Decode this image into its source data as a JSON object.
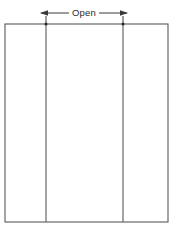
{
  "diagram": {
    "title": "Open",
    "background_color": "#ffffff",
    "line_color": "#5a5a5a",
    "dimension_color": "#3a3a3a",
    "text_color": "#2b2b2b",
    "dimension": {
      "label": "Open",
      "label_x": 84,
      "label_y": 13,
      "line_y": 13,
      "left_x": 40,
      "right_x": 128,
      "arrow_style": "double-headed"
    },
    "outline": {
      "x": 5,
      "y": 24,
      "width": 163,
      "height": 198
    },
    "dividers": [
      {
        "name": "left-divider",
        "x": 46,
        "y_top": 24,
        "y_bottom": 222
      },
      {
        "name": "right-divider",
        "x": 123,
        "y_top": 24,
        "y_bottom": 222
      }
    ],
    "junction_dots": [
      {
        "cx": 46,
        "cy": 24
      },
      {
        "cx": 123,
        "cy": 24
      }
    ],
    "panels": [
      {
        "name": "left-panel",
        "x": 5,
        "width": 41,
        "label": ""
      },
      {
        "name": "center-panel",
        "x": 46,
        "width": 77,
        "label": ""
      },
      {
        "name": "right-panel",
        "x": 123,
        "width": 45,
        "label": ""
      }
    ]
  }
}
